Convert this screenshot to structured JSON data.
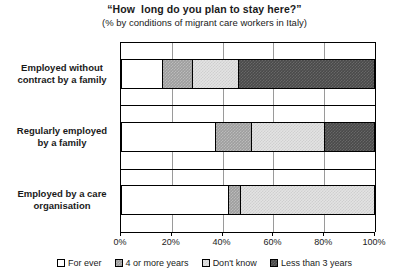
{
  "chart_data": {
    "type": "bar",
    "orientation": "horizontal",
    "stacked": true,
    "stack_total": 100,
    "title": "“How  long do you plan to stay here?”",
    "subtitle": "(% by conditions of migrant care workers in Italy)",
    "xlabel": "",
    "ylabel": "",
    "xlim": [
      0,
      100
    ],
    "xticks": [
      0,
      20,
      40,
      60,
      80,
      100
    ],
    "xticklabels": [
      "0%",
      "20%",
      "40%",
      "60%",
      "80%",
      "100%"
    ],
    "grid": true,
    "legend_position": "bottom",
    "categories": [
      "Employed without contract by a family",
      "Regularly employed by a family",
      "Employed by a care organisation"
    ],
    "category_lines": [
      [
        "Employed without",
        "contract by a family"
      ],
      [
        "Regularly employed",
        "by a family"
      ],
      [
        "Employed by a care",
        "organisation"
      ]
    ],
    "series": [
      {
        "name": "For ever",
        "key": "forever",
        "color": "#ffffff",
        "values": [
          16,
          37,
          42
        ]
      },
      {
        "name": "4 or more years",
        "key": "fourplus",
        "color": "#9e9e9e",
        "values": [
          12,
          14,
          5
        ]
      },
      {
        "name": "Don't know",
        "key": "dontknow",
        "color": "#e3e3e3",
        "values": [
          18,
          29,
          53
        ]
      },
      {
        "name": "Less than 3 years",
        "key": "lessthan3",
        "color": "#4a4a4a",
        "values": [
          54,
          20,
          0
        ]
      }
    ]
  },
  "legend": {
    "items": [
      {
        "label": "For ever",
        "swatch": "forever"
      },
      {
        "label": "4 or more years",
        "swatch": "fourplus"
      },
      {
        "label": "Don't know",
        "swatch": "dontknow"
      },
      {
        "label": "Less than 3 years",
        "swatch": "lessthan3"
      }
    ]
  }
}
